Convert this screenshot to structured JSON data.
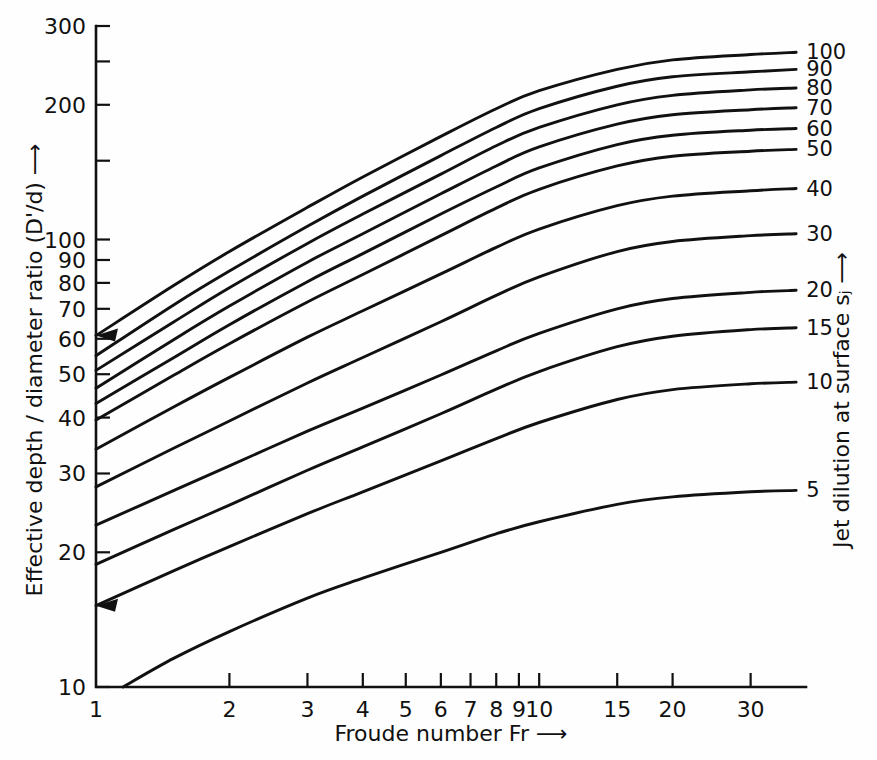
{
  "chart_data": {
    "type": "line",
    "title": "",
    "subtitle": "",
    "xlabel": "Froude number Fr ⟶",
    "ylabel": "Effective depth / diameter ratio (D'/d) ⟶",
    "y2label": "Jet dilution at surface sⱼ ⟶",
    "xscale": "log",
    "yscale": "log",
    "xlim": [
      1,
      40
    ],
    "ylim": [
      10,
      300
    ],
    "grid": false,
    "legend_position": "right-curve-end-labels",
    "xticks": [
      1,
      2,
      3,
      4,
      5,
      6,
      7,
      8,
      9,
      10,
      15,
      20,
      30
    ],
    "xtick_labels": [
      "1",
      "2",
      "3",
      "4",
      "5",
      "6",
      "7",
      "8",
      "9",
      "10",
      "15",
      "20",
      "30"
    ],
    "yticks": [
      10,
      20,
      30,
      40,
      50,
      60,
      70,
      80,
      90,
      100,
      150,
      200,
      250,
      300
    ],
    "ytick_labels": [
      "10",
      "20",
      "30",
      "40",
      "50",
      "60",
      "70",
      "80",
      "90",
      "100",
      "",
      "200",
      "",
      "300"
    ],
    "series_label_name": "Jet dilution at surface sj",
    "series": [
      {
        "name": "100",
        "label": "100",
        "y_at_x1": 61.0,
        "y_at_xmax": 262.0,
        "has_left_arrow": true,
        "points": [
          [
            1,
            61.0
          ],
          [
            1.5,
            79.0
          ],
          [
            2,
            94.0
          ],
          [
            3,
            118.0
          ],
          [
            4,
            138.0
          ],
          [
            6,
            170.0
          ],
          [
            8,
            196.0
          ],
          [
            10,
            215.0
          ],
          [
            15,
            240.0
          ],
          [
            20,
            252.0
          ],
          [
            30,
            259.0
          ],
          [
            38,
            262.0
          ]
        ]
      },
      {
        "name": "90",
        "label": "90",
        "y_at_x1": 55.0,
        "y_at_xmax": 240.0,
        "has_left_arrow": false,
        "points": [
          [
            1,
            55.0
          ],
          [
            1.5,
            71.5
          ],
          [
            2,
            85.0
          ],
          [
            3,
            107.0
          ],
          [
            4,
            125.0
          ],
          [
            6,
            154.0
          ],
          [
            8,
            178.0
          ],
          [
            10,
            196.0
          ],
          [
            15,
            220.0
          ],
          [
            20,
            231.0
          ],
          [
            30,
            237.0
          ],
          [
            38,
            240.0
          ]
        ]
      },
      {
        "name": "80",
        "label": "80",
        "y_at_x1": 51.0,
        "y_at_xmax": 218.0,
        "has_left_arrow": false,
        "points": [
          [
            1,
            51.0
          ],
          [
            1.5,
            65.5
          ],
          [
            2,
            78.0
          ],
          [
            3,
            98.0
          ],
          [
            4,
            114.0
          ],
          [
            6,
            140.0
          ],
          [
            8,
            162.0
          ],
          [
            10,
            178.0
          ],
          [
            15,
            200.0
          ],
          [
            20,
            210.0
          ],
          [
            30,
            216.0
          ],
          [
            38,
            218.0
          ]
        ]
      },
      {
        "name": "70",
        "label": "70",
        "y_at_x1": 46.5,
        "y_at_xmax": 197.0,
        "has_left_arrow": false,
        "points": [
          [
            1,
            46.5
          ],
          [
            1.5,
            59.8
          ],
          [
            2,
            71.0
          ],
          [
            3,
            89.0
          ],
          [
            4,
            103.0
          ],
          [
            6,
            126.5
          ],
          [
            8,
            146.0
          ],
          [
            10,
            161.0
          ],
          [
            15,
            181.0
          ],
          [
            20,
            190.0
          ],
          [
            30,
            195.0
          ],
          [
            38,
            197.0
          ]
        ]
      },
      {
        "name": "60",
        "label": "60",
        "y_at_x1": 43.0,
        "y_at_xmax": 177.0,
        "has_left_arrow": false,
        "points": [
          [
            1,
            43.0
          ],
          [
            1.5,
            54.5
          ],
          [
            2,
            64.5
          ],
          [
            3,
            80.5
          ],
          [
            4,
            93.0
          ],
          [
            6,
            114.0
          ],
          [
            8,
            131.0
          ],
          [
            10,
            144.5
          ],
          [
            15,
            163.0
          ],
          [
            20,
            171.0
          ],
          [
            30,
            175.5
          ],
          [
            38,
            177.0
          ]
        ]
      },
      {
        "name": "50",
        "label": "50",
        "y_at_x1": 39.5,
        "y_at_xmax": 159.0,
        "has_left_arrow": false,
        "points": [
          [
            1,
            39.5
          ],
          [
            1.5,
            49.8
          ],
          [
            2,
            58.5
          ],
          [
            3,
            72.5
          ],
          [
            4,
            83.5
          ],
          [
            6,
            102.0
          ],
          [
            8,
            117.5
          ],
          [
            10,
            129.5
          ],
          [
            15,
            146.0
          ],
          [
            20,
            153.5
          ],
          [
            30,
            157.5
          ],
          [
            38,
            159.0
          ]
        ]
      },
      {
        "name": "40",
        "label": "40",
        "y_at_x1": 34.0,
        "y_at_xmax": 130.0,
        "has_left_arrow": false,
        "points": [
          [
            1,
            34.0
          ],
          [
            1.5,
            42.3
          ],
          [
            2,
            49.2
          ],
          [
            3,
            60.5
          ],
          [
            4,
            69.3
          ],
          [
            6,
            83.8
          ],
          [
            8,
            96.0
          ],
          [
            10,
            105.5
          ],
          [
            15,
            119.0
          ],
          [
            20,
            125.0
          ],
          [
            30,
            128.5
          ],
          [
            38,
            130.0
          ]
        ]
      },
      {
        "name": "30",
        "label": "30",
        "y_at_x1": 28.0,
        "y_at_xmax": 103.0,
        "has_left_arrow": false,
        "points": [
          [
            1,
            28.0
          ],
          [
            1.5,
            34.2
          ],
          [
            2,
            39.3
          ],
          [
            3,
            47.8
          ],
          [
            4,
            54.5
          ],
          [
            6,
            65.5
          ],
          [
            8,
            75.0
          ],
          [
            10,
            82.5
          ],
          [
            15,
            94.0
          ],
          [
            20,
            99.0
          ],
          [
            30,
            102.0
          ],
          [
            38,
            103.0
          ]
        ]
      },
      {
        "name": "20",
        "label": "20",
        "y_at_x1": 23.0,
        "y_at_xmax": 77.0,
        "has_left_arrow": false,
        "points": [
          [
            1,
            23.0
          ],
          [
            1.5,
            27.5
          ],
          [
            2,
            31.2
          ],
          [
            3,
            37.3
          ],
          [
            4,
            42.0
          ],
          [
            6,
            49.8
          ],
          [
            8,
            56.4
          ],
          [
            10,
            61.7
          ],
          [
            15,
            70.0
          ],
          [
            20,
            73.8
          ],
          [
            30,
            76.2
          ],
          [
            38,
            77.0
          ]
        ]
      },
      {
        "name": "15",
        "label": "15",
        "y_at_x1": 18.8,
        "y_at_xmax": 63.5,
        "has_left_arrow": false,
        "points": [
          [
            1,
            18.8
          ],
          [
            1.5,
            22.5
          ],
          [
            2,
            25.5
          ],
          [
            3,
            30.5
          ],
          [
            4,
            34.4
          ],
          [
            6,
            40.8
          ],
          [
            8,
            46.3
          ],
          [
            10,
            50.7
          ],
          [
            15,
            57.6
          ],
          [
            20,
            60.8
          ],
          [
            30,
            62.9
          ],
          [
            38,
            63.5
          ]
        ]
      },
      {
        "name": "10",
        "label": "10",
        "y_at_x1": 15.2,
        "y_at_xmax": 48.0,
        "has_left_arrow": true,
        "points": [
          [
            1,
            15.2
          ],
          [
            1.5,
            18.2
          ],
          [
            2,
            20.6
          ],
          [
            3,
            24.4
          ],
          [
            4,
            27.3
          ],
          [
            6,
            32.0
          ],
          [
            8,
            35.9
          ],
          [
            10,
            39.0
          ],
          [
            15,
            43.9
          ],
          [
            20,
            46.2
          ],
          [
            30,
            47.6
          ],
          [
            38,
            48.0
          ]
        ]
      },
      {
        "name": "5",
        "label": "5",
        "y_at_x1": 10.0,
        "y_at_xmax": 27.5,
        "has_left_arrow": false,
        "points": [
          [
            1.15,
            10.0
          ],
          [
            1.5,
            11.6
          ],
          [
            2,
            13.3
          ],
          [
            3,
            15.8
          ],
          [
            4,
            17.5
          ],
          [
            6,
            20.0
          ],
          [
            8,
            22.0
          ],
          [
            10,
            23.4
          ],
          [
            15,
            25.6
          ],
          [
            20,
            26.6
          ],
          [
            30,
            27.3
          ],
          [
            38,
            27.5
          ]
        ]
      }
    ]
  }
}
